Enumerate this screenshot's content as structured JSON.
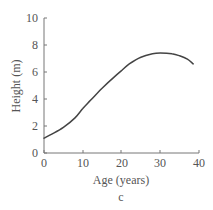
{
  "chart_data": {
    "type": "line",
    "title": "",
    "caption": "c",
    "xlabel": "Age (years)",
    "ylabel": "Height (m)",
    "xlim": [
      0,
      40
    ],
    "ylim": [
      0,
      10
    ],
    "xticks": [
      0,
      10,
      20,
      30,
      40
    ],
    "yticks": [
      0,
      2,
      4,
      6,
      8,
      10
    ],
    "grid": false,
    "legend": null,
    "series": [
      {
        "name": "Height",
        "color": "#444444",
        "x": [
          0,
          2,
          5,
          8,
          10,
          12,
          15,
          18,
          20,
          22,
          25,
          28,
          30,
          33,
          35,
          37,
          38.5
        ],
        "y": [
          1.1,
          1.4,
          1.9,
          2.6,
          3.3,
          3.9,
          4.8,
          5.6,
          6.1,
          6.6,
          7.1,
          7.35,
          7.4,
          7.35,
          7.2,
          6.95,
          6.6
        ]
      }
    ]
  },
  "labels": {
    "xlabel": "Age (years)",
    "ylabel": "Height (m)",
    "caption": "c",
    "xticks": [
      "0",
      "10",
      "20",
      "30",
      "40"
    ],
    "yticks": [
      "0",
      "2",
      "4",
      "6",
      "8",
      "10"
    ]
  },
  "colors": {
    "axis": "#777777",
    "line": "#444444",
    "text": "#555555"
  }
}
